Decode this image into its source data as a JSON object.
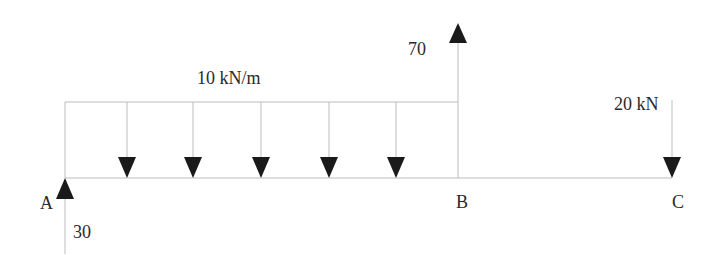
{
  "diagram": {
    "type": "beam-free-body-diagram",
    "distributed_load": {
      "label": "10 kN/m",
      "from": "A",
      "to": "B",
      "arrow_count": 5
    },
    "point_loads": [
      {
        "point": "A",
        "value_label": "30",
        "direction": "up"
      },
      {
        "point": "B",
        "value_label": "70",
        "direction": "up"
      },
      {
        "point": "C",
        "value_label": "20 kN",
        "direction": "down"
      }
    ],
    "points": [
      {
        "label": "A"
      },
      {
        "label": "B"
      },
      {
        "label": "C"
      }
    ],
    "colors": {
      "line": "#b8b8b8",
      "arrow": "#1a1a1a",
      "text": "#2a2a2a"
    }
  }
}
